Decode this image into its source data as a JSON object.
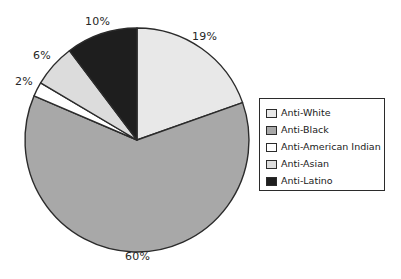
{
  "chart_data": {
    "type": "pie",
    "title": "",
    "categories": [
      "Anti-White",
      "Anti-Black",
      "Anti-American Indian",
      "Anti-Asian",
      "Anti-Latino"
    ],
    "values": [
      19,
      60,
      2,
      6,
      10
    ],
    "value_unit": "%",
    "data_labels": [
      "19%",
      "60%",
      "2%",
      "6%",
      "10%"
    ],
    "colors": [
      "#e8e8e8",
      "#a8a8a8",
      "#ffffff",
      "#dcdcdc",
      "#1e1e1e"
    ],
    "start_angle_deg": 0,
    "direction": "clockwise",
    "legend_position": "right",
    "grid": false,
    "xlabel": "",
    "ylabel": ""
  },
  "labels": {
    "anti_white_pct": "19%",
    "anti_black_pct": "60%",
    "anti_american_indian_pct": "2%",
    "anti_asian_pct": "6%",
    "anti_latino_pct": "10%"
  },
  "legend": {
    "items": [
      {
        "label": "Anti-White",
        "color": "#e8e8e8"
      },
      {
        "label": "Anti-Black",
        "color": "#a8a8a8"
      },
      {
        "label": "Anti-American Indian",
        "color": "#ffffff"
      },
      {
        "label": "Anti-Asian",
        "color": "#dcdcdc"
      },
      {
        "label": "Anti-Latino",
        "color": "#1e1e1e"
      }
    ]
  },
  "style": {
    "outline_color": "#2b2b2b",
    "background": "#ffffff"
  }
}
